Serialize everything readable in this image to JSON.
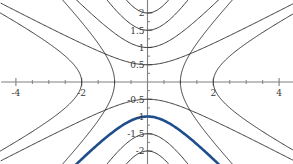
{
  "chart_data": {
    "type": "line",
    "title": "",
    "subtitle": "",
    "xlabel": "",
    "ylabel": "",
    "xlim": [
      -4.45,
      4.45
    ],
    "ylim": [
      -2.4,
      2.4
    ],
    "grid": false,
    "legend_position": "none",
    "background_color": "#ffffff",
    "axis_color": "#808080",
    "curve_color": "#2b2b2b",
    "highlight_color": "#1f4e8c",
    "xaxis": {
      "major_ticks": [
        -4,
        -2,
        2,
        4
      ],
      "major_tick_labels": [
        "-4",
        "-2",
        "2",
        "4"
      ],
      "minor_ticks": [
        -3.5,
        -3,
        -2.5,
        -1.5,
        -1,
        -0.5,
        0.5,
        1,
        1.5,
        2.5,
        3,
        3.5
      ],
      "axis_position_y": 0
    },
    "yaxis": {
      "major_ticks": [
        -2,
        -1.5,
        -1,
        -0.5,
        0.5,
        1,
        1.5,
        2
      ],
      "major_tick_labels": [
        "-2",
        "-1.5",
        "-1",
        "-0.5",
        "0.5",
        "1",
        "1.5",
        "2"
      ],
      "minor_ticks": [
        -1.75,
        -1.25,
        -0.75,
        -0.25,
        0.25,
        0.75,
        1.25,
        1.75
      ],
      "axis_position_x": 0
    },
    "series": [
      {
        "name": "upper-branch-a0.5",
        "orientation": "vertical",
        "vertex": [
          0,
          0.5
        ],
        "a": 0.5,
        "b": 1.0,
        "color": "#2b2b2b",
        "width": 1.0,
        "highlight": false
      },
      {
        "name": "upper-branch-a1",
        "orientation": "vertical",
        "vertex": [
          0,
          1
        ],
        "a": 1.0,
        "b": 1.0,
        "color": "#2b2b2b",
        "width": 1.0,
        "highlight": false
      },
      {
        "name": "upper-branch-a1.5",
        "orientation": "vertical",
        "vertex": [
          0,
          1.5
        ],
        "a": 1.5,
        "b": 1.0,
        "color": "#2b2b2b",
        "width": 1.0,
        "highlight": false
      },
      {
        "name": "upper-branch-a2",
        "orientation": "vertical",
        "vertex": [
          0,
          2
        ],
        "a": 2.0,
        "b": 1.0,
        "color": "#2b2b2b",
        "width": 1.0,
        "highlight": false
      },
      {
        "name": "lower-branch-a0.5",
        "orientation": "vertical",
        "vertex": [
          0,
          -0.5
        ],
        "a": 0.5,
        "b": 1.0,
        "color": "#2b2b2b",
        "width": 1.0,
        "highlight": false
      },
      {
        "name": "lower-branch-a1-highlighted",
        "orientation": "vertical",
        "vertex": [
          0,
          -1
        ],
        "a": 1.0,
        "b": 1.0,
        "color": "#1f4e8c",
        "width": 2.6,
        "highlight": true
      },
      {
        "name": "lower-branch-a1.5",
        "orientation": "vertical",
        "vertex": [
          0,
          -1.5
        ],
        "a": 1.5,
        "b": 1.0,
        "color": "#2b2b2b",
        "width": 1.0,
        "highlight": false
      },
      {
        "name": "lower-branch-a2",
        "orientation": "vertical",
        "vertex": [
          0,
          -2
        ],
        "a": 2.0,
        "b": 1.0,
        "color": "#2b2b2b",
        "width": 1.0,
        "highlight": false
      },
      {
        "name": "right-branch-a1",
        "orientation": "horizontal",
        "vertex": [
          1,
          0
        ],
        "a": 1.0,
        "b": 1.0,
        "color": "#2b2b2b",
        "width": 1.0,
        "highlight": false
      },
      {
        "name": "right-branch-a2",
        "orientation": "horizontal",
        "vertex": [
          2,
          0
        ],
        "a": 2.0,
        "b": 1.0,
        "color": "#2b2b2b",
        "width": 1.0,
        "highlight": false
      },
      {
        "name": "left-branch-a1",
        "orientation": "horizontal",
        "vertex": [
          -1,
          0
        ],
        "a": 1.0,
        "b": 1.0,
        "color": "#2b2b2b",
        "width": 1.0,
        "highlight": false
      },
      {
        "name": "left-branch-a2",
        "orientation": "horizontal",
        "vertex": [
          -2,
          0
        ],
        "a": 2.0,
        "b": 1.0,
        "color": "#2b2b2b",
        "width": 1.0,
        "highlight": false
      }
    ]
  }
}
